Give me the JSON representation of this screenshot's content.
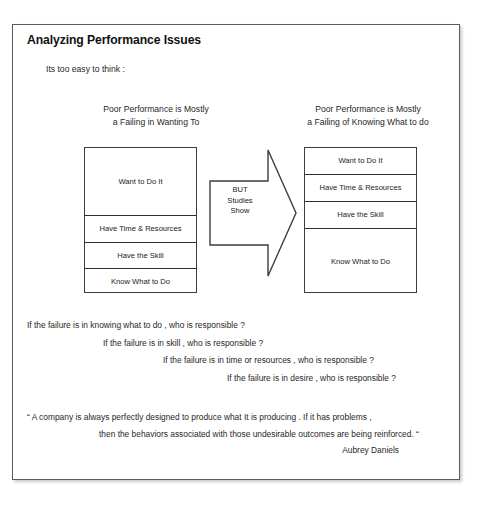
{
  "slide": {
    "title": "Analyzing Performance Issues",
    "intro": "Its too easy to think :"
  },
  "columns": {
    "left": {
      "caption_line1": "Poor Performance is Mostly",
      "caption_line2": "a Failing in Wanting To",
      "rows": [
        "Want to Do It",
        "Have Time & Resources",
        "Have the Skill",
        "Know What to Do"
      ]
    },
    "right": {
      "caption_line1": "Poor Performance is Mostly",
      "caption_line2": "a Failing of Knowing What to do",
      "rows": [
        "Want to Do It",
        "Have Time & Resources",
        "Have the Skill",
        "Know What to Do"
      ]
    }
  },
  "arrow": {
    "icon": "right-arrow-icon",
    "label_line1": "BUT",
    "label_line2": "Studies",
    "label_line3": "Show"
  },
  "questions": [
    "If the failure is in knowing what to do , who is responsible ?",
    "If the failure is in skill , who is responsible ?",
    "If the failure is in time or resources , who is responsible ?",
    "If the failure is in desire , who is responsible ?"
  ],
  "quote": {
    "line1": "“ A company is always perfectly designed to produce what It is producing . If it has problems ,",
    "line2": "then the behaviors associated with those undesirable outcomes are being reinforced. “",
    "attribution": "Aubrey Daniels"
  },
  "colors": {
    "frame_border": "#5b5b5b",
    "box_border": "#3d3d3d",
    "divider": "#2e2e2e",
    "text": "#1f1f1f",
    "background": "#ffffff"
  }
}
